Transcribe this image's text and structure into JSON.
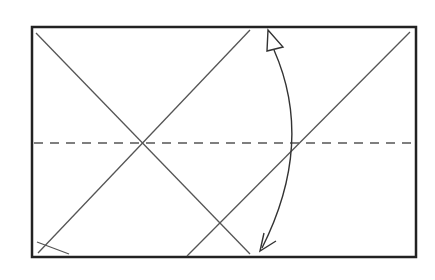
{
  "diagram": {
    "type": "fold-diagram",
    "canvas": {
      "width": 435,
      "height": 280,
      "background": "#ffffff"
    },
    "colors": {
      "frame": "#222222",
      "fold_line": "#555555",
      "dashed_line": "#555555",
      "arrow": "#333333"
    },
    "frame": {
      "x": 32,
      "y": 27,
      "width": 384,
      "height": 230
    },
    "crease_lines": [
      {
        "id": "diag-down-left",
        "x1": 36,
        "y1": 33,
        "x2": 250,
        "y2": 254
      },
      {
        "id": "diag-up-left",
        "x1": 250,
        "y1": 30,
        "x2": 38,
        "y2": 253
      },
      {
        "id": "diag-up-right",
        "x1": 410,
        "y1": 32,
        "x2": 187,
        "y2": 256
      },
      {
        "id": "corner-small",
        "x1": 37,
        "y1": 242,
        "x2": 69,
        "y2": 254
      }
    ],
    "dashed_line": {
      "x1": 34,
      "y1": 143,
      "x2": 414,
      "y2": 143,
      "dash": "9 7"
    },
    "fold_arrow": {
      "path": "M 274 50 Q 315 143 262 248",
      "head_top": "hollow-triangle",
      "head_bottom": "open-v"
    }
  }
}
